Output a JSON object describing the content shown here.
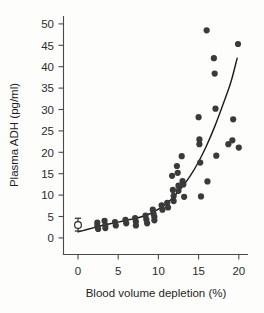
{
  "chart_data": {
    "type": "scatter",
    "title": "",
    "xlabel": "Blood volume depletion (%)",
    "ylabel": "Plasma ADH (pg/ml)",
    "xlim": [
      -2,
      21.5
    ],
    "ylim": [
      -2,
      52
    ],
    "xticks": [
      0,
      5,
      10,
      15,
      20
    ],
    "yticks": [
      0,
      5,
      10,
      15,
      20,
      25,
      30,
      35,
      40,
      45,
      50
    ],
    "xtick_labels": [
      "0",
      "5",
      "10",
      "15",
      "20"
    ],
    "ytick_labels": [
      "0",
      "5",
      "10",
      "15",
      "20",
      "25",
      "30",
      "35",
      "40",
      "45",
      "50"
    ],
    "grid": false,
    "legend": false,
    "marker_color": "#3a3a3a",
    "curve_color": "#1a1a1a",
    "background_color": "#fdfdfc",
    "points": [
      [
        2.4,
        3.6
      ],
      [
        2.4,
        2.8
      ],
      [
        2.5,
        2.1
      ],
      [
        3.3,
        4.0
      ],
      [
        3.4,
        3.0
      ],
      [
        3.4,
        2.3
      ],
      [
        4.6,
        3.7
      ],
      [
        4.7,
        2.9
      ],
      [
        5.9,
        4.2
      ],
      [
        6.0,
        3.4
      ],
      [
        7.1,
        4.6
      ],
      [
        7.2,
        3.8
      ],
      [
        7.2,
        2.9
      ],
      [
        8.4,
        5.2
      ],
      [
        8.5,
        4.3
      ],
      [
        8.6,
        3.4
      ],
      [
        9.3,
        6.6
      ],
      [
        9.4,
        5.6
      ],
      [
        9.5,
        4.9
      ],
      [
        9.5,
        4.1
      ],
      [
        10.4,
        7.6
      ],
      [
        10.5,
        6.6
      ],
      [
        11.1,
        8.2
      ],
      [
        11.2,
        7.1
      ],
      [
        11.7,
        14.5
      ],
      [
        11.8,
        11.2
      ],
      [
        11.9,
        9.8
      ],
      [
        11.9,
        8.6
      ],
      [
        12.3,
        16.8
      ],
      [
        12.4,
        15.2
      ],
      [
        12.5,
        12.2
      ],
      [
        12.5,
        11.0
      ],
      [
        12.9,
        19.1
      ],
      [
        13.0,
        13.3
      ],
      [
        13.1,
        12.5
      ],
      [
        13.2,
        9.6
      ],
      [
        15.0,
        28.2
      ],
      [
        15.1,
        23.0
      ],
      [
        15.1,
        21.9
      ],
      [
        15.2,
        17.6
      ],
      [
        15.3,
        9.7
      ],
      [
        16.0,
        48.5
      ],
      [
        16.1,
        13.2
      ],
      [
        16.9,
        42.0
      ],
      [
        17.0,
        38.4
      ],
      [
        17.1,
        30.2
      ],
      [
        17.2,
        19.2
      ],
      [
        18.7,
        21.9
      ],
      [
        19.2,
        22.8
      ],
      [
        19.3,
        27.7
      ],
      [
        19.9,
        45.3
      ],
      [
        20.0,
        21.1
      ]
    ],
    "reference_point": {
      "x": 0,
      "y": 3.0,
      "err_low": 1.6,
      "err_high": 4.6,
      "style": "open-circle"
    },
    "fit_curve": [
      [
        0,
        1.4
      ],
      [
        1,
        1.9
      ],
      [
        2,
        2.4
      ],
      [
        3,
        2.9
      ],
      [
        4,
        3.3
      ],
      [
        5,
        3.7
      ],
      [
        6,
        4.1
      ],
      [
        7,
        4.5
      ],
      [
        8,
        5.0
      ],
      [
        9,
        5.7
      ],
      [
        10,
        6.7
      ],
      [
        11,
        8.0
      ],
      [
        12,
        9.8
      ],
      [
        13,
        12.0
      ],
      [
        14,
        14.6
      ],
      [
        15,
        17.8
      ],
      [
        16,
        21.6
      ],
      [
        17,
        26.0
      ],
      [
        18,
        31.0
      ],
      [
        19,
        36.3
      ],
      [
        19.8,
        42.0
      ]
    ]
  }
}
